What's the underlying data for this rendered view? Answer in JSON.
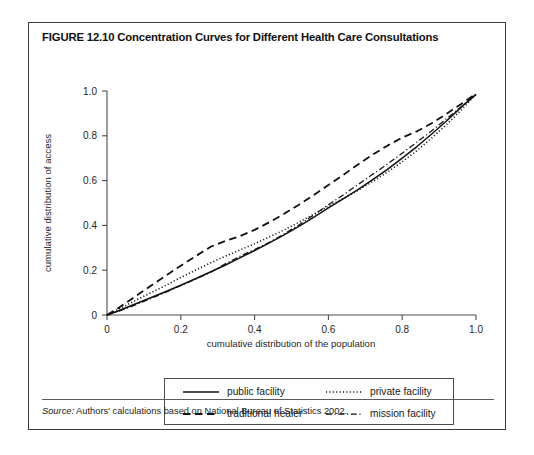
{
  "figure": {
    "title": "FIGURE 12.10  Concentration Curves for Different Health Care Consultations",
    "source_lead": "Source:",
    "source_text": " Authors' calculations based on National Bureau of Statistics 2002."
  },
  "legend": {
    "entries": [
      {
        "label": "public facility",
        "style": "solid"
      },
      {
        "label": "private facility",
        "style": "dotted"
      },
      {
        "label": "traditional healer",
        "style": "dashed"
      },
      {
        "label": "mission facility",
        "style": "dashdot"
      }
    ]
  },
  "chart_data": {
    "type": "line",
    "title": "Concentration Curves for Different Health Care Consultations",
    "xlabel": "cumulative distribution of the population",
    "ylabel": "cumulative distribution of access",
    "xlim": [
      0,
      1.0
    ],
    "ylim": [
      0,
      1.0
    ],
    "xticks": [
      "0",
      "0.2",
      "0.4",
      "0.6",
      "0.8",
      "1.0"
    ],
    "xtick_values": [
      0,
      0.2,
      0.4,
      0.6,
      0.8,
      1.0
    ],
    "yticks": [
      "0",
      "0.2",
      "0.4",
      "0.6",
      "0.8",
      "1.0"
    ],
    "ytick_values": [
      0,
      0.2,
      0.4,
      0.6,
      0.8,
      1.0
    ],
    "grid": false,
    "legend_position": "below-plot",
    "series": [
      {
        "name": "public facility",
        "style": "solid",
        "x": [
          0,
          0.03,
          0.06,
          0.09,
          0.12,
          0.16,
          0.2,
          0.24,
          0.28,
          0.32,
          0.36,
          0.4,
          0.44,
          0.48,
          0.52,
          0.56,
          0.6,
          0.64,
          0.68,
          0.72,
          0.76,
          0.8,
          0.84,
          0.88,
          0.92,
          0.96,
          1.0
        ],
        "y": [
          0,
          0.018,
          0.038,
          0.058,
          0.078,
          0.105,
          0.133,
          0.162,
          0.192,
          0.222,
          0.255,
          0.288,
          0.322,
          0.358,
          0.396,
          0.436,
          0.478,
          0.518,
          0.56,
          0.604,
          0.65,
          0.7,
          0.752,
          0.808,
          0.866,
          0.928,
          0.985
        ]
      },
      {
        "name": "private facility",
        "style": "dotted",
        "x": [
          0,
          0.03,
          0.06,
          0.09,
          0.12,
          0.16,
          0.2,
          0.24,
          0.28,
          0.32,
          0.36,
          0.4,
          0.44,
          0.48,
          0.52,
          0.56,
          0.6,
          0.64,
          0.68,
          0.72,
          0.76,
          0.8,
          0.84,
          0.88,
          0.92,
          0.96,
          1.0
        ],
        "y": [
          0,
          0.024,
          0.05,
          0.076,
          0.1,
          0.133,
          0.168,
          0.2,
          0.232,
          0.262,
          0.29,
          0.318,
          0.348,
          0.38,
          0.414,
          0.45,
          0.486,
          0.52,
          0.556,
          0.596,
          0.638,
          0.684,
          0.734,
          0.79,
          0.85,
          0.915,
          0.985
        ]
      },
      {
        "name": "traditional healer",
        "style": "dashed",
        "x": [
          0,
          0.03,
          0.06,
          0.09,
          0.12,
          0.16,
          0.2,
          0.24,
          0.28,
          0.32,
          0.36,
          0.4,
          0.44,
          0.48,
          0.52,
          0.56,
          0.6,
          0.64,
          0.68,
          0.72,
          0.76,
          0.8,
          0.84,
          0.88,
          0.92,
          0.96,
          1.0
        ],
        "y": [
          0,
          0.03,
          0.064,
          0.098,
          0.132,
          0.176,
          0.22,
          0.262,
          0.304,
          0.33,
          0.352,
          0.38,
          0.414,
          0.452,
          0.492,
          0.535,
          0.58,
          0.625,
          0.672,
          0.716,
          0.756,
          0.792,
          0.82,
          0.856,
          0.898,
          0.942,
          0.988
        ]
      },
      {
        "name": "mission facility",
        "style": "dashdot",
        "x": [
          0,
          0.03,
          0.06,
          0.09,
          0.12,
          0.16,
          0.2,
          0.24,
          0.28,
          0.32,
          0.36,
          0.4,
          0.44,
          0.48,
          0.52,
          0.56,
          0.6,
          0.64,
          0.68,
          0.72,
          0.76,
          0.8,
          0.84,
          0.88,
          0.92,
          0.96,
          1.0
        ],
        "y": [
          0,
          0.016,
          0.034,
          0.054,
          0.074,
          0.102,
          0.132,
          0.16,
          0.19,
          0.228,
          0.262,
          0.292,
          0.324,
          0.362,
          0.402,
          0.446,
          0.492,
          0.536,
          0.582,
          0.628,
          0.674,
          0.722,
          0.772,
          0.822,
          0.876,
          0.93,
          0.985
        ]
      }
    ]
  }
}
